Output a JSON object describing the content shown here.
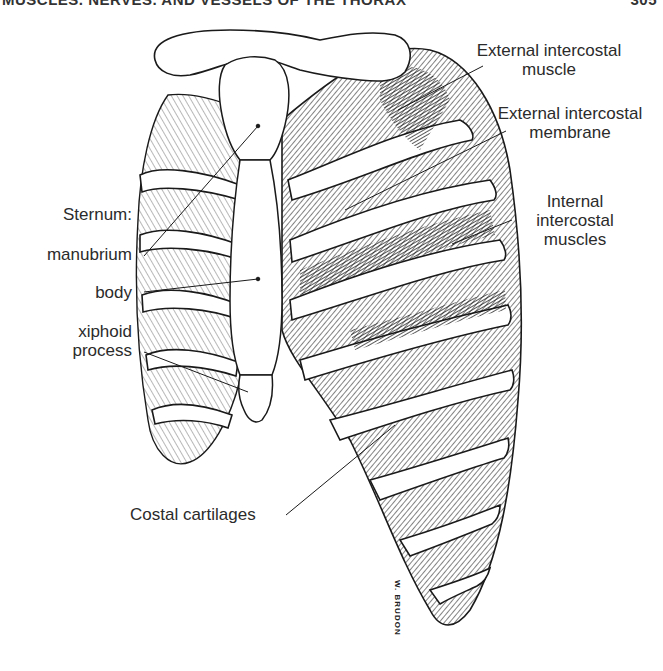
{
  "header": {
    "running_title": "MUSCLES, NERVES, AND VESSELS OF THE THORAX",
    "page_number": "305"
  },
  "figure": {
    "labels": {
      "external_intercostal_muscle": [
        "External intercostal",
        "muscle"
      ],
      "external_intercostal_membrane": [
        "External intercostal",
        "membrane"
      ],
      "internal_intercostal_muscles": [
        "Internal",
        "intercostal",
        "muscles"
      ],
      "sternum": "Sternum:",
      "manubrium": "manubrium",
      "body": "body",
      "xiphoid_process": [
        "xiphoid",
        "process"
      ],
      "costal_cartilages": "Costal cartilages"
    },
    "artist_signature": "W. BRUDON",
    "colors": {
      "ink": "#1a1a1a",
      "background": "#ffffff",
      "label_text": "#2b2b2b"
    }
  }
}
